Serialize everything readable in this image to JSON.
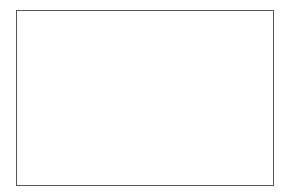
{
  "colors": {
    "background": "#ffffff",
    "frame": "#555555",
    "stroke": "#444444",
    "shaded": "#6e6e6e",
    "light_stroke": "#888888"
  },
  "figure": {
    "top_shape": {
      "triangles": [
        {
          "points": "69,82 104,42 104,82",
          "fill": "white"
        },
        {
          "points": "104,42 143,82 104,82",
          "fill": "shaded"
        },
        {
          "points": "104,42 143,42 143,82",
          "fill": "shaded"
        },
        {
          "points": "143,82 184,42 184,82",
          "fill": "white"
        },
        {
          "points": "143,42 184,42 143,82",
          "fill": "white"
        },
        {
          "points": "184,42 224,82 184,82",
          "fill": "shaded"
        }
      ]
    },
    "options": [
      {
        "points": "46,155 75,122 75,155",
        "fill": "white"
      },
      {
        "points": "80,155 109,122 109,155",
        "fill": "shaded"
      },
      {
        "points": "116,155 144,122 144,155",
        "fill": "shaded"
      },
      {
        "points": "150,155 178,122 178,155",
        "fill": "white"
      },
      {
        "points": "183,155 212,122 212,155",
        "fill": "white"
      },
      {
        "points": "218,155 246,122 246,155",
        "fill": "shaded"
      }
    ]
  }
}
